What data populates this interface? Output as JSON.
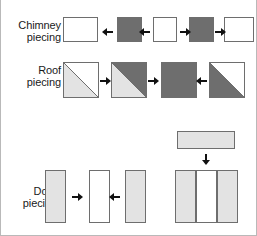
{
  "diagram": {
    "colors": {
      "white": "#ffffff",
      "light_gray": "#e3e3e3",
      "dark_gray": "#6e6e6e",
      "outline": "#6e6e6e",
      "arrow": "#111111",
      "text": "#1a1a1a",
      "page_border": "#b9b9b9"
    },
    "rows": [
      {
        "id": "chimney",
        "label_line1": "Chimney",
        "label_line2": "piecing",
        "pieces": [
          {
            "name": "chimney-piece-1",
            "shape": "rectangle",
            "fill": "white"
          },
          {
            "name": "chimney-piece-2",
            "shape": "square",
            "fill": "dark_gray"
          },
          {
            "name": "chimney-piece-3",
            "shape": "square",
            "fill": "white"
          },
          {
            "name": "chimney-piece-4",
            "shape": "square",
            "fill": "dark_gray"
          },
          {
            "name": "chimney-piece-5",
            "shape": "rectangle",
            "fill": "white"
          }
        ],
        "arrows": [
          "left",
          "left",
          "right",
          "right"
        ]
      },
      {
        "id": "roof",
        "label_line1": "Roof",
        "label_line2": "piecing",
        "pieces": [
          {
            "name": "roof-piece-1",
            "shape": "half-square-triangle",
            "fill_upper_left": "white",
            "fill_lower_right": "light_gray",
            "diagonal": "bottom-left-to-top-right"
          },
          {
            "name": "roof-piece-2",
            "shape": "half-square-triangle",
            "fill_upper_right": "dark_gray",
            "fill_lower_left": "light_gray",
            "diagonal": "bottom-left-to-top-right"
          },
          {
            "name": "roof-piece-3",
            "shape": "square",
            "fill": "dark_gray"
          },
          {
            "name": "roof-piece-4",
            "shape": "half-square-triangle",
            "fill_upper_right": "white",
            "fill_lower_left": "dark_gray",
            "diagonal": "bottom-left-to-top-right"
          }
        ],
        "arrows": [
          "right",
          "right",
          "left"
        ]
      },
      {
        "id": "door",
        "label_line1": "Door",
        "label_line2": "piecing",
        "pieces": [
          {
            "name": "door-piece-left",
            "shape": "vertical-strip",
            "fill": "light_gray"
          },
          {
            "name": "door-piece-center",
            "shape": "vertical-strip",
            "fill": "white"
          },
          {
            "name": "door-piece-right",
            "shape": "vertical-strip",
            "fill": "light_gray"
          }
        ],
        "arrows": [
          "right",
          "left"
        ],
        "assembly": {
          "top_bar": {
            "name": "door-top-bar",
            "shape": "horizontal-bar",
            "fill": "light_gray"
          },
          "arrow": "down",
          "unit_panels": [
            {
              "name": "door-unit-panel-left",
              "fill": "light_gray"
            },
            {
              "name": "door-unit-panel-center",
              "fill": "white"
            },
            {
              "name": "door-unit-panel-right",
              "fill": "light_gray"
            }
          ]
        }
      }
    ]
  }
}
